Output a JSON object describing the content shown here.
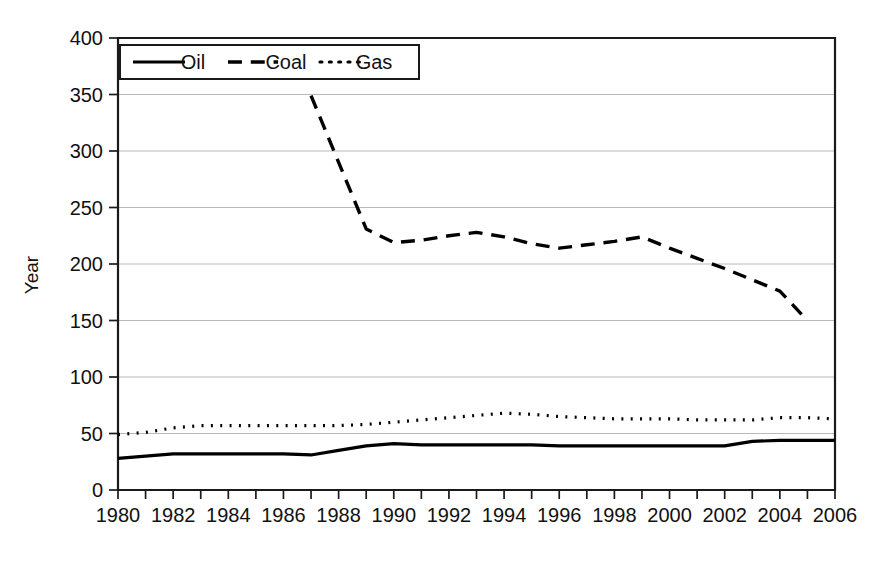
{
  "chart_data": {
    "type": "line",
    "title": "",
    "xlabel": "",
    "ylabel": "Year",
    "xlim": [
      1980,
      2006
    ],
    "ylim": [
      0,
      400
    ],
    "grid": true,
    "grid_axis": "y",
    "legend_position": "top-left-inside",
    "y_ticks": [
      0,
      50,
      100,
      150,
      200,
      250,
      300,
      350,
      400
    ],
    "x_ticks": [
      1980,
      1981,
      1982,
      1983,
      1984,
      1985,
      1986,
      1987,
      1988,
      1989,
      1990,
      1991,
      1992,
      1993,
      1994,
      1995,
      1996,
      1997,
      1998,
      1999,
      2000,
      2001,
      2002,
      2003,
      2004,
      2005,
      2006
    ],
    "x_tick_labels": [
      "1980",
      "",
      "1982",
      "",
      "1984",
      "",
      "1986",
      "",
      "1988",
      "",
      "1990",
      "",
      "1992",
      "",
      "1994",
      "",
      "1996",
      "",
      "1998",
      "",
      "2000",
      "",
      "2002",
      "",
      "2004",
      "",
      "2006"
    ],
    "y_tick_labels": [
      "0",
      "50",
      "100",
      "150",
      "200",
      "250",
      "300",
      "350",
      "400"
    ],
    "series": [
      {
        "name": "Oil",
        "style": "solid",
        "color": "#000000",
        "width": 3.2,
        "x": [
          1980,
          1981,
          1982,
          1983,
          1984,
          1985,
          1986,
          1987,
          1988,
          1989,
          1990,
          1991,
          1992,
          1993,
          1994,
          1995,
          1996,
          1997,
          1998,
          1999,
          2000,
          2001,
          2002,
          2003,
          2004,
          2005,
          2006
        ],
        "values": [
          28,
          30,
          32,
          32,
          32,
          32,
          32,
          31,
          35,
          39,
          41,
          40,
          40,
          40,
          40,
          40,
          39,
          39,
          39,
          39,
          39,
          39,
          39,
          43,
          44,
          44,
          44
        ]
      },
      {
        "name": "Coal",
        "style": "dashed",
        "color": "#000000",
        "width": 3.4,
        "x": [
          1987,
          1988,
          1989,
          1990,
          1991,
          1992,
          1993,
          1994,
          1995,
          1996,
          1997,
          1998,
          1999,
          2000,
          2001,
          2002,
          2003,
          2004,
          2005
        ],
        "values": [
          349,
          290,
          231,
          219,
          221,
          225,
          228,
          224,
          218,
          214,
          217,
          220,
          224,
          214,
          205,
          196,
          186,
          176,
          150
        ]
      },
      {
        "name": "Gas",
        "style": "dotted",
        "color": "#000000",
        "width": 3.2,
        "x": [
          1980,
          1981,
          1982,
          1983,
          1984,
          1985,
          1986,
          1987,
          1988,
          1989,
          1990,
          1991,
          1992,
          1993,
          1994,
          1995,
          1996,
          1997,
          1998,
          1999,
          2000,
          2001,
          2002,
          2003,
          2004,
          2005,
          2006
        ],
        "values": [
          49,
          51,
          55,
          57,
          57,
          57,
          57,
          57,
          57,
          58,
          60,
          62,
          64,
          66,
          68,
          67,
          65,
          64,
          63,
          63,
          63,
          62,
          62,
          62,
          64,
          64,
          63
        ]
      }
    ]
  },
  "legend": {
    "entries": [
      {
        "label": "Oil",
        "style": "solid"
      },
      {
        "label": "Coal",
        "style": "dashed"
      },
      {
        "label": "Gas",
        "style": "dotted"
      }
    ]
  },
  "axes": {
    "y_title": "Year"
  }
}
